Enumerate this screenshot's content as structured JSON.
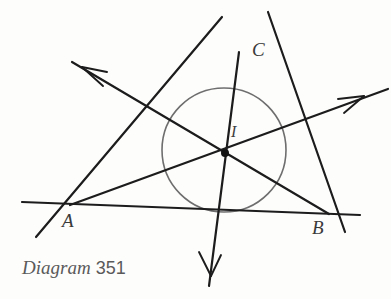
{
  "figure": {
    "kind": "geometry-diagram",
    "background_color": "#fdfdfc",
    "stroke_color": "#1c1c1c",
    "circle_color": "#6e6e6e",
    "label_color": "#3a3a3a",
    "caption_color": "#5a5a5a"
  },
  "caption": {
    "word": "Diagram",
    "number": "351"
  },
  "labels": {
    "vertex_a": "A",
    "vertex_b": "B",
    "vertex_c": "C",
    "incenter": "I"
  },
  "points": {
    "A": {
      "x": 70,
      "y": 205
    },
    "B": {
      "x": 329,
      "y": 214
    },
    "C": {
      "x": 239,
      "y": 52
    },
    "I": {
      "x": 225,
      "y": 153
    }
  },
  "incircle": {
    "cx": 224,
    "cy": 150,
    "r": 62
  },
  "label_positions": {
    "A": {
      "x": 62,
      "y": 211
    },
    "B": {
      "x": 312,
      "y": 218
    },
    "C": {
      "x": 252,
      "y": 40
    },
    "I": {
      "x": 231,
      "y": 124
    }
  },
  "triangle_sides": [
    {
      "name": "side-ab",
      "x1": 22,
      "y1": 202,
      "x2": 360,
      "y2": 215
    },
    {
      "name": "side-ca",
      "x1": 36,
      "y1": 237,
      "x2": 222,
      "y2": 17
    },
    {
      "name": "side-cb",
      "x1": 268,
      "y1": 12,
      "x2": 345,
      "y2": 232
    }
  ],
  "bisector_rays": [
    {
      "name": "bisector-from-b",
      "x1": 329,
      "y1": 214,
      "x2": 72,
      "y2": 62,
      "arrow_at": "end"
    },
    {
      "name": "bisector-from-a",
      "x1": 70,
      "y1": 205,
      "x2": 388,
      "y2": 89,
      "arrow_at": "end"
    },
    {
      "name": "bisector-from-c",
      "x1": 239,
      "y1": 52,
      "x2": 209,
      "y2": 286,
      "arrow_at": "end"
    }
  ],
  "arrowheads": [
    {
      "name": "arrowhead-upper-left",
      "tip_x": 78,
      "tip_y": 65,
      "angle_deg": 210
    },
    {
      "name": "arrowhead-right",
      "tip_x": 364,
      "tip_y": 97,
      "angle_deg": 340
    },
    {
      "name": "arrowhead-down",
      "tip_x": 211,
      "tip_y": 275,
      "angle_deg": 97
    }
  ],
  "incenter_dot": {
    "cx": 225,
    "cy": 153,
    "r": 4
  }
}
